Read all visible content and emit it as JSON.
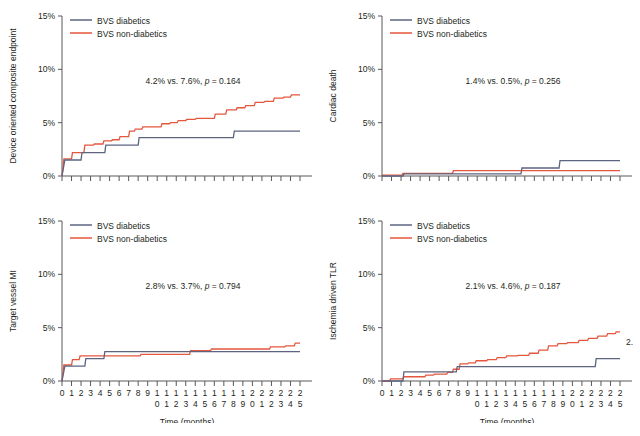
{
  "figure": {
    "title": "",
    "colors": {
      "diabetics": "#5c6480",
      "non_diabetics": "#e4573c",
      "axis": "#58595b",
      "text": "#231f20"
    },
    "legend": {
      "diabetics_label": "BVS diabetics",
      "non_diabetics_label": "BVS non-diabetics"
    },
    "axis": {
      "x_title": "Time (months)",
      "y_ticks": [
        "0%",
        "5%",
        "10%",
        "15%"
      ],
      "y_tick_values": [
        0,
        5,
        10,
        15
      ],
      "x_tick_values": [
        0,
        1,
        2,
        3,
        4,
        5,
        6,
        7,
        8,
        9,
        10,
        11,
        12,
        13,
        14,
        15,
        16,
        17,
        18,
        19,
        20,
        21,
        22,
        23,
        24,
        25
      ],
      "x_tick_labels": [
        "0",
        "1",
        "2",
        "3",
        "4",
        "5",
        "6",
        "7",
        "8",
        "9",
        "10",
        "11",
        "12",
        "13",
        "14",
        "15",
        "16",
        "17",
        "18",
        "19",
        "20",
        "21",
        "22",
        "23",
        "24",
        "25"
      ],
      "ylim": [
        0,
        15
      ],
      "xlim": [
        0,
        25
      ]
    },
    "overflow_label": "2."
  },
  "chart_data": [
    {
      "id": "device-oriented-composite-endpoint",
      "type": "line",
      "subtype": "kaplan-meier-step",
      "title": "",
      "ylabel": "Device oriented composite endpoint",
      "xlabel": "Time (months)",
      "ylim": [
        0,
        15
      ],
      "xlim": [
        0,
        25
      ],
      "grid": false,
      "legend_position": "top-left",
      "annotation": "4.2% vs. 7.6%, p = 0.164",
      "annotation_parts": {
        "stats": "4.2% vs. 7.6%, ",
        "p_italic": "p",
        "p_value": " = 0.164"
      },
      "series": [
        {
          "name": "BVS diabetics",
          "color": "#5c6480",
          "x": [
            0,
            0.3,
            2.0,
            2.1,
            4.5,
            4.6,
            5.9,
            6.0,
            8.0,
            8.1,
            18.0,
            18.1,
            25.0
          ],
          "values": [
            0,
            1.5,
            1.5,
            2.2,
            2.2,
            2.9,
            2.9,
            2.9,
            2.9,
            3.6,
            3.6,
            4.2,
            4.2
          ],
          "final_value": 4.2
        },
        {
          "name": "BVS non-diabetics",
          "color": "#e4573c",
          "x": [
            0,
            0.2,
            1.0,
            1.1,
            2.3,
            2.4,
            3.3,
            3.4,
            4.3,
            4.4,
            5.2,
            5.3,
            6.0,
            6.1,
            7.0,
            7.1,
            7.6,
            7.7,
            8.4,
            8.5,
            9.4,
            9.5,
            10.4,
            10.5,
            11.3,
            11.4,
            12.1,
            12.2,
            13.0,
            13.1,
            14.0,
            14.1,
            15.0,
            15.1,
            16.0,
            16.1,
            17.2,
            17.3,
            18.3,
            18.4,
            19.2,
            19.3,
            20.2,
            20.3,
            21.2,
            21.3,
            22.2,
            22.3,
            23.2,
            23.3,
            24.0,
            24.1,
            25.0
          ],
          "values": [
            0,
            1.6,
            1.6,
            2.2,
            2.2,
            2.9,
            2.9,
            3.0,
            3.0,
            3.3,
            3.3,
            3.4,
            3.4,
            3.7,
            3.7,
            4.2,
            4.2,
            4.4,
            4.4,
            4.6,
            4.6,
            4.6,
            4.6,
            4.9,
            4.9,
            5.0,
            5.0,
            5.2,
            5.2,
            5.3,
            5.3,
            5.4,
            5.4,
            5.4,
            5.4,
            5.8,
            5.8,
            6.2,
            6.2,
            6.4,
            6.4,
            6.6,
            6.6,
            6.9,
            6.9,
            7.0,
            7.0,
            7.3,
            7.3,
            7.4,
            7.4,
            7.6,
            7.6
          ],
          "final_value": 7.6
        }
      ]
    },
    {
      "id": "cardiac-death",
      "type": "line",
      "subtype": "kaplan-meier-step",
      "title": "",
      "ylabel": "Cardiac death",
      "xlabel": "Time (months)",
      "ylim": [
        0,
        15
      ],
      "xlim": [
        0,
        25
      ],
      "grid": false,
      "legend_position": "top-left",
      "annotation": "1.4% vs. 0.5%, p = 0.256",
      "annotation_parts": {
        "stats": "1.4% vs. 0.5%, ",
        "p_italic": "p",
        "p_value": " = 0.256"
      },
      "series": [
        {
          "name": "BVS diabetics",
          "color": "#5c6480",
          "x": [
            0,
            2.2,
            2.3,
            14.6,
            14.7,
            18.6,
            18.7,
            25.0
          ],
          "values": [
            0,
            0,
            0.2,
            0.2,
            0.75,
            0.75,
            1.45,
            1.45
          ],
          "final_value": 1.4
        },
        {
          "name": "BVS non-diabetics",
          "color": "#e4573c",
          "x": [
            0,
            2.1,
            2.2,
            7.4,
            7.5,
            25.0
          ],
          "values": [
            0.08,
            0.08,
            0.25,
            0.25,
            0.5,
            0.5
          ],
          "final_value": 0.5
        }
      ]
    },
    {
      "id": "target-vessel-mi",
      "type": "line",
      "subtype": "kaplan-meier-step",
      "title": "",
      "ylabel": "Target vessel MI",
      "xlabel": "Time (months)",
      "ylim": [
        0,
        15
      ],
      "xlim": [
        0,
        25
      ],
      "grid": false,
      "legend_position": "top-left",
      "annotation": "2.8% vs. 3.7%, p = 0.794",
      "annotation_parts": {
        "stats": "2.8% vs. 3.7%, ",
        "p_italic": "p",
        "p_value": " = 0.794"
      },
      "series": [
        {
          "name": "BVS diabetics",
          "color": "#5c6480",
          "x": [
            0,
            0.3,
            2.4,
            2.5,
            4.4,
            4.5,
            25.0
          ],
          "values": [
            0,
            1.4,
            1.4,
            2.1,
            2.1,
            2.75,
            2.75
          ],
          "final_value": 2.8
        },
        {
          "name": "BVS non-diabetics",
          "color": "#e4573c",
          "x": [
            0,
            0.2,
            1.0,
            1.1,
            1.8,
            1.9,
            8.2,
            8.3,
            13.4,
            13.5,
            15.6,
            15.7,
            21.8,
            21.9,
            23.4,
            23.5,
            24.4,
            24.5,
            25.0
          ],
          "values": [
            0,
            1.5,
            1.5,
            2.0,
            2.0,
            2.35,
            2.35,
            2.5,
            2.5,
            2.85,
            2.85,
            3.0,
            3.0,
            3.2,
            3.2,
            3.3,
            3.3,
            3.55,
            3.55
          ],
          "final_value": 3.7
        }
      ]
    },
    {
      "id": "ischemia-driven-tlr",
      "type": "line",
      "subtype": "kaplan-meier-step",
      "title": "",
      "ylabel": "Ischemia driven TLR",
      "xlabel": "Time (months)",
      "ylim": [
        0,
        15
      ],
      "xlim": [
        0,
        25
      ],
      "grid": false,
      "legend_position": "top-left",
      "annotation": "2.1% vs. 4.6%, p = 0.187",
      "annotation_parts": {
        "stats": "2.1% vs. 4.6%, ",
        "p_italic": "p",
        "p_value": " = 0.187"
      },
      "series": [
        {
          "name": "BVS diabetics",
          "color": "#5c6480",
          "x": [
            0,
            2.2,
            2.3,
            7.2,
            7.3,
            7.8,
            7.9,
            22.4,
            22.5,
            25.0
          ],
          "values": [
            0,
            0,
            0.85,
            0.85,
            0.85,
            0.85,
            1.35,
            1.35,
            2.1,
            2.1
          ],
          "final_value": 2.1
        },
        {
          "name": "BVS non-diabetics",
          "color": "#e4573c",
          "x": [
            0,
            0.8,
            0.9,
            2.2,
            2.3,
            4.5,
            4.6,
            5.4,
            5.5,
            6.8,
            6.9,
            7.4,
            7.5,
            8.1,
            8.2,
            9.0,
            9.1,
            9.8,
            9.9,
            11.0,
            11.1,
            12.0,
            12.1,
            13.0,
            13.1,
            14.2,
            14.3,
            15.4,
            15.5,
            16.4,
            16.5,
            17.4,
            17.5,
            18.4,
            18.5,
            19.4,
            19.5,
            20.6,
            20.7,
            21.6,
            21.7,
            22.6,
            22.7,
            23.6,
            23.7,
            24.5,
            24.6,
            25.0
          ],
          "values": [
            0,
            0,
            0.2,
            0.2,
            0.4,
            0.4,
            0.55,
            0.55,
            0.65,
            0.65,
            0.8,
            0.8,
            1.1,
            1.1,
            1.6,
            1.6,
            1.7,
            1.7,
            1.9,
            1.9,
            2.0,
            2.0,
            2.2,
            2.2,
            2.35,
            2.35,
            2.4,
            2.4,
            2.6,
            2.6,
            2.9,
            2.9,
            3.3,
            3.3,
            3.5,
            3.5,
            3.6,
            3.6,
            3.8,
            3.8,
            4.0,
            4.0,
            4.2,
            4.2,
            4.45,
            4.45,
            4.6,
            4.6
          ],
          "final_value": 4.6
        }
      ]
    }
  ]
}
